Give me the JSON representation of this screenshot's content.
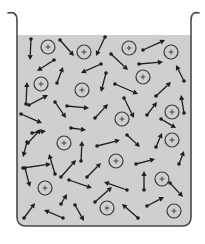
{
  "diagram": {
    "title": "",
    "colors": {
      "liquid": "#cfcfcf",
      "glass": "#4a4a4a",
      "arrow": "#1e1e1e",
      "ion": "#3a3a3a"
    },
    "beaker": {
      "left_x": 17,
      "right_x": 191,
      "top_y": 12,
      "bottom_y": 226,
      "liquid_surface_y": 35,
      "corner_radius": 9
    },
    "ion_label": "+",
    "ion_radius": 7,
    "ions": [
      [
        48,
        47
      ],
      [
        84,
        52
      ],
      [
        129,
        48
      ],
      [
        171,
        52
      ],
      [
        143,
        77
      ],
      [
        41,
        84
      ],
      [
        82,
        90
      ],
      [
        122,
        119
      ],
      [
        172,
        112
      ],
      [
        64,
        143
      ],
      [
        116,
        161
      ],
      [
        172,
        140
      ],
      [
        162,
        179
      ],
      [
        45,
        188
      ],
      [
        107,
        208
      ],
      [
        174,
        211
      ]
    ],
    "dipoles": [
      [
        [
          31,
          39
        ],
        [
          30,
          60
        ]
      ],
      [
        [
          60,
          40
        ],
        [
          74,
          56
        ]
      ],
      [
        [
          105,
          37
        ],
        [
          96,
          56
        ]
      ],
      [
        [
          143,
          50
        ],
        [
          165,
          40
        ]
      ],
      [
        [
          111,
          54
        ],
        [
          128,
          70
        ]
      ],
      [
        [
          54,
          60
        ],
        [
          37,
          71
        ]
      ],
      [
        [
          101,
          64
        ],
        [
          81,
          73
        ]
      ],
      [
        [
          139,
          64
        ],
        [
          163,
          62
        ]
      ],
      [
        [
          57,
          83
        ],
        [
          63,
          67
        ]
      ],
      [
        [
          106,
          73
        ],
        [
          101,
          92
        ]
      ],
      [
        [
          26,
          104
        ],
        [
          27,
          82
        ]
      ],
      [
        [
          29,
          105
        ],
        [
          48,
          95
        ]
      ],
      [
        [
          115,
          84
        ],
        [
          138,
          94
        ]
      ],
      [
        [
          156,
          96
        ],
        [
          171,
          82
        ]
      ],
      [
        [
          184,
          81
        ],
        [
          176,
          65
        ]
      ],
      [
        [
          55,
          102
        ],
        [
          66,
          118
        ]
      ],
      [
        [
          67,
          106
        ],
        [
          89,
          108
        ]
      ],
      [
        [
          95,
          118
        ],
        [
          108,
          104
        ]
      ],
      [
        [
          124,
          98
        ],
        [
          134,
          118
        ]
      ],
      [
        [
          147,
          115
        ],
        [
          157,
          102
        ]
      ],
      [
        [
          21,
          114
        ],
        [
          42,
          123
        ]
      ],
      [
        [
          184,
          113
        ],
        [
          181,
          95
        ]
      ],
      [
        [
          161,
          119
        ],
        [
          176,
          128
        ]
      ],
      [
        [
          32,
          133
        ],
        [
          46,
          131
        ]
      ],
      [
        [
          71,
          128
        ],
        [
          86,
          130
        ]
      ],
      [
        [
          27,
          142
        ],
        [
          23,
          157
        ]
      ],
      [
        [
          28,
          143
        ],
        [
          41,
          129
        ]
      ],
      [
        [
          81,
          161
        ],
        [
          82,
          141
        ]
      ],
      [
        [
          97,
          146
        ],
        [
          120,
          140
        ]
      ],
      [
        [
          127,
          135
        ],
        [
          140,
          147
        ]
      ],
      [
        [
          156,
          147
        ],
        [
          162,
          133
        ]
      ],
      [
        [
          23,
          168
        ],
        [
          51,
          164
        ]
      ],
      [
        [
          55,
          174
        ],
        [
          49,
          154
        ]
      ],
      [
        [
          61,
          177
        ],
        [
          76,
          160
        ]
      ],
      [
        [
          87,
          177
        ],
        [
          101,
          163
        ]
      ],
      [
        [
          25,
          168
        ],
        [
          30,
          187
        ]
      ],
      [
        [
          136,
          164
        ],
        [
          155,
          159
        ]
      ],
      [
        [
          144,
          190
        ],
        [
          144,
          171
        ]
      ],
      [
        [
          69,
          180
        ],
        [
          92,
          188
        ]
      ],
      [
        [
          127,
          190
        ],
        [
          104,
          182
        ]
      ],
      [
        [
          170,
          183
        ],
        [
          183,
          197
        ]
      ],
      [
        [
          179,
          164
        ],
        [
          184,
          151
        ]
      ],
      [
        [
          61,
          204
        ],
        [
          67,
          194
        ]
      ],
      [
        [
          95,
          202
        ],
        [
          112,
          187
        ]
      ],
      [
        [
          24,
          218
        ],
        [
          35,
          203
        ]
      ],
      [
        [
          63,
          218
        ],
        [
          44,
          210
        ]
      ],
      [
        [
          75,
          205
        ],
        [
          84,
          221
        ]
      ],
      [
        [
          138,
          218
        ],
        [
          122,
          204
        ]
      ],
      [
        [
          147,
          206
        ],
        [
          164,
          197
        ]
      ]
    ]
  }
}
